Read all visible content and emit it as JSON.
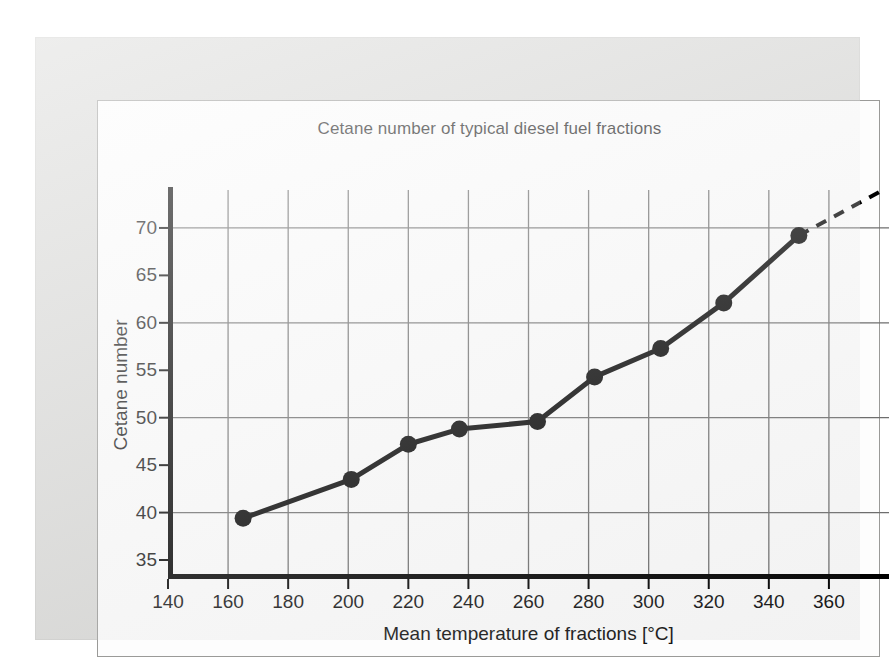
{
  "chart_data": {
    "type": "line",
    "title": "Cetane number of typical diesel fuel fractions",
    "xlabel": "Mean temperature of fractions [°C]",
    "ylabel": "Cetane number",
    "xlim": [
      140,
      380
    ],
    "ylim": [
      33,
      74
    ],
    "xticks": [
      140,
      160,
      180,
      200,
      220,
      240,
      260,
      280,
      300,
      320,
      340,
      360
    ],
    "xtick_labels": [
      "140",
      "160",
      "180",
      "200",
      "220",
      "240",
      "260",
      "280",
      "300",
      "320",
      "340",
      "360"
    ],
    "yticks": [
      35,
      40,
      45,
      50,
      55,
      60,
      65,
      70
    ],
    "ytick_labels": [
      "35",
      "40",
      "45",
      "50",
      "55",
      "60",
      "65",
      "70"
    ],
    "grid": true,
    "x_gridlines": [
      160,
      180,
      200,
      220,
      240,
      260,
      280,
      300,
      320,
      340,
      360
    ],
    "y_gridlines": [
      40,
      50,
      60,
      70
    ],
    "legend": null,
    "series": [
      {
        "name": "Cetane number",
        "style": "solid",
        "marker": "filled-circle",
        "color": "#000000",
        "x": [
          165,
          201,
          220,
          237,
          263,
          282,
          304,
          325,
          350
        ],
        "y": [
          39.4,
          43.5,
          47.2,
          48.8,
          49.6,
          54.3,
          57.3,
          62.1,
          69.2
        ]
      },
      {
        "name": "Extrapolation",
        "style": "dashed",
        "marker": "none",
        "color": "#000000",
        "x": [
          350,
          378
        ],
        "y": [
          69.2,
          74.0
        ]
      }
    ]
  }
}
